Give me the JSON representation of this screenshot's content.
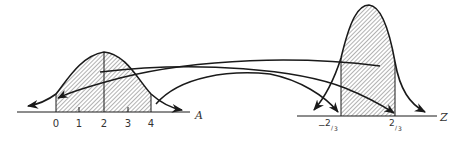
{
  "diagram": {
    "left_plot": {
      "axis_label": "A",
      "tick_labels": [
        "0",
        "1",
        "2",
        "3",
        "4"
      ],
      "shaded_interval": [
        "0",
        "4"
      ],
      "mean_line": "2"
    },
    "right_plot": {
      "axis_label": "Z",
      "tick_labels": {
        "lower": {
          "sign": "−",
          "num": "2",
          "den": "3"
        },
        "upper": {
          "sign": "",
          "num": "2",
          "den": "3"
        }
      },
      "shaded_interval": [
        "-2/3",
        "2/3"
      ]
    },
    "arrows": [
      {
        "from": "left-plot lower bound region",
        "to": "right-plot lower bound"
      },
      {
        "from": "right-plot lower region",
        "to": "left-plot lower bound"
      },
      {
        "from": "left-plot upper region",
        "to": "right-plot upper bound"
      },
      {
        "from": "right-plot upper region",
        "to": "left-plot upper bound"
      }
    ],
    "colors": {
      "stroke": "#1a1a1a",
      "hatch": "#555555",
      "text": "#333333",
      "background": "#ffffff"
    }
  }
}
